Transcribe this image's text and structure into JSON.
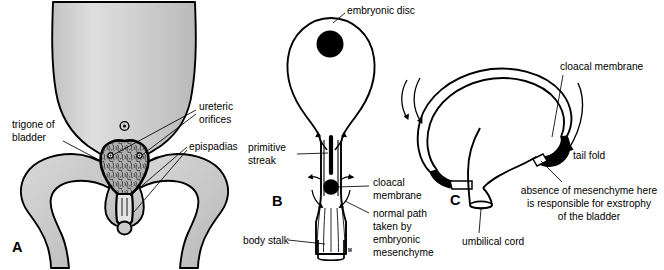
{
  "figure": {
    "background_color": "#ffffff",
    "ink_color": "#000000",
    "body_fill_color": "#c9c9c9",
    "body_fill_light": "#dcdcdc"
  },
  "panel_a": {
    "letter": "A",
    "labels": {
      "trigone": "trigone of",
      "trigone_line2": "bladder",
      "ureteric": "ureteric",
      "ureteric_line2": "orifices",
      "epispadias": "epispadias"
    }
  },
  "panel_b": {
    "letter": "B",
    "labels": {
      "embryonic_disc": "embryonic disc",
      "primitive_streak": "primitive",
      "primitive_streak_line2": "streak",
      "cloacal_membrane": "cloacal",
      "cloacal_membrane_line2": "membrane",
      "normal_path_1": "normal path",
      "normal_path_2": "taken by",
      "normal_path_3": "embryonic",
      "normal_path_4": "mesenchyme",
      "body_stalk": "body stalk",
      "tiny_mark": "M"
    }
  },
  "panel_c": {
    "letter": "C",
    "labels": {
      "cloacal_membrane": "cloacal membrane",
      "tail_fold": "tail fold",
      "absence_1": "absence of mesenchyme here",
      "absence_2": "is responsible for exstrophy",
      "absence_3": "of the bladder",
      "umbilical_cord": "umbilical cord"
    }
  }
}
